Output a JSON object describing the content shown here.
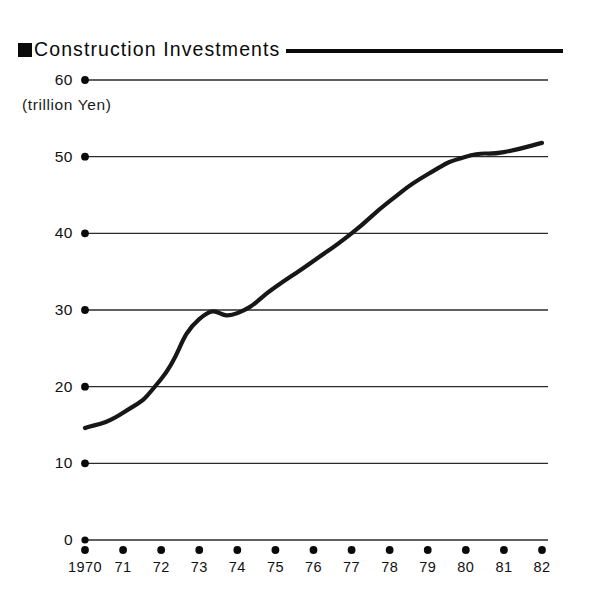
{
  "title": {
    "bullet": "black-square-bullet",
    "text": "Construction Investments"
  },
  "unit_label": "(trillion Yen)",
  "chart_data": {
    "type": "line",
    "title": "Construction Investments",
    "subtitle": "",
    "xlabel": "",
    "ylabel": "(trillion Yen)",
    "ylim": [
      0,
      60
    ],
    "yticks": [
      0,
      10,
      20,
      30,
      40,
      50,
      60
    ],
    "ytick_labels": [
      "0",
      "10",
      "20",
      "30",
      "40",
      "50",
      "60"
    ],
    "grid": true,
    "grid_axis": "y",
    "legend": "none",
    "x": [
      1970,
      1971,
      1972,
      1973,
      1974,
      1975,
      1976,
      1977,
      1978,
      1979,
      1980,
      1981,
      1982
    ],
    "xtick_labels": [
      "1970",
      "71",
      "72",
      "73",
      "74",
      "75",
      "76",
      "77",
      "78",
      "79",
      "80",
      "81",
      "82"
    ],
    "series": [
      {
        "name": "Construction Investments",
        "color": "#171717",
        "values": [
          14.6,
          16.6,
          21.0,
          28.8,
          29.6,
          33.0,
          36.4,
          40.0,
          44.2,
          47.7,
          50.0,
          50.6,
          51.8
        ]
      }
    ]
  },
  "colors": {
    "ink": "#111111",
    "line": "#171717",
    "grid": "#2b2b2b",
    "background": "#ffffff"
  }
}
